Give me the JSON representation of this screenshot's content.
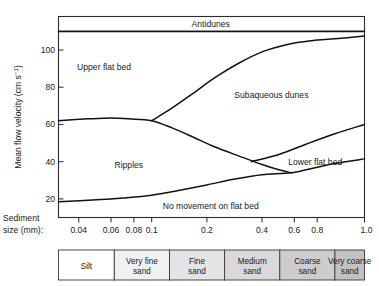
{
  "figure": {
    "title": "",
    "type": "bedform-stability-diagram"
  },
  "axes": {
    "y_label_main": "Mean flow velocity (cm s",
    "y_label_exponent": "−1",
    "y_label_close": ")",
    "y_label_full": "Mean flow velocity (cm s⁻¹)",
    "y_ticks": [
      "20",
      "40",
      "60",
      "80",
      "100"
    ],
    "y_tick_values": [
      20,
      40,
      60,
      80,
      100
    ],
    "y_min": 10,
    "y_max": 118,
    "x_label_line1": "Sediment",
    "x_label_line2": "size (mm):",
    "x_ticks": [
      "0.04",
      "0.06",
      "0.08",
      "0.1",
      "0.2",
      "0.4",
      "0.6",
      "0.8",
      "1.0"
    ],
    "x_tick_values": [
      0.04,
      0.06,
      0.08,
      0.1,
      0.2,
      0.4,
      0.6,
      0.8,
      1.0
    ],
    "x_min": 0.031,
    "x_max": 1.45,
    "x_scale": "log"
  },
  "fields": [
    {
      "name": "antidunes",
      "label": "Antidunes"
    },
    {
      "name": "upper-flat-bed",
      "label": "Upper flat bed"
    },
    {
      "name": "subaqueous-dunes",
      "label": "Subaqueous dunes"
    },
    {
      "name": "ripples",
      "label": "Ripples"
    },
    {
      "name": "lower-flat-bed",
      "label": "Lower flat bed"
    },
    {
      "name": "no-movement",
      "label": "No movement on flat bed"
    }
  ],
  "sediment_scale": {
    "cells": [
      {
        "label_line1": "Silt",
        "label_line2": "",
        "fill": "#ffffff",
        "d_start": 0.031,
        "d_end": 0.0625
      },
      {
        "label_line1": "Very fine",
        "label_line2": "sand",
        "fill": "#f1f1f1",
        "d_start": 0.0625,
        "d_end": 0.125
      },
      {
        "label_line1": "Fine",
        "label_line2": "sand",
        "fill": "#e4e4e4",
        "d_start": 0.125,
        "d_end": 0.25
      },
      {
        "label_line1": "Medium",
        "label_line2": "sand",
        "fill": "#d9d9d9",
        "d_start": 0.25,
        "d_end": 0.5
      },
      {
        "label_line1": "Coarse",
        "label_line2": "sand",
        "fill": "#cdcdcd",
        "d_start": 0.5,
        "d_end": 1.0
      },
      {
        "label_line1": "Very coarse",
        "label_line2": "sand",
        "fill": "#c2c2c2",
        "d_start": 1.0,
        "d_end": 1.45
      }
    ]
  },
  "chart_data": {
    "type": "line",
    "xlabel": "Sediment size (mm)",
    "ylabel": "Mean flow velocity (cm s⁻¹)",
    "xscale": "log",
    "yscale": "linear",
    "xlim": [
      0.031,
      1.45
    ],
    "ylim": [
      10,
      118
    ],
    "grid": false,
    "legend": null,
    "xticks": [
      0.04,
      0.06,
      0.08,
      0.1,
      0.2,
      0.4,
      0.6,
      0.8,
      1.0
    ],
    "xticklabels": [
      "0.04",
      "0.06",
      "0.08",
      "0.1",
      "0.2",
      "0.4",
      "0.6",
      "0.8",
      "1.0"
    ],
    "yticks": [
      20,
      40,
      60,
      80,
      100
    ],
    "yticklabels": [
      "20",
      "40",
      "60",
      "80",
      "100"
    ],
    "annotations": [
      {
        "text": "Antidunes",
        "x": 0.21,
        "y": 114
      },
      {
        "text": "Upper flat bed",
        "x": 0.055,
        "y": 91
      },
      {
        "text": "Subaqueous dunes",
        "x": 0.45,
        "y": 76
      },
      {
        "text": "Ripples",
        "x": 0.075,
        "y": 38
      },
      {
        "text": "Lower flat bed",
        "x": 0.78,
        "y": 40
      },
      {
        "text": "No movement on flat bed",
        "x": 0.21,
        "y": 16
      }
    ],
    "series": [
      {
        "name": "antidunes-boundary",
        "description": "Horizontal boundary between upper flat bed / subaqueous dunes and antidunes",
        "x": [
          0.031,
          1.45
        ],
        "y": [
          110,
          110
        ]
      },
      {
        "name": "upper-flat-bed-upper-boundary",
        "description": "Boundary between upper flat bed and subaqueous dunes; rises from branch point at 0.1 mm",
        "x": [
          0.1,
          0.13,
          0.17,
          0.22,
          0.3,
          0.4,
          0.55,
          0.75,
          1.0,
          1.45
        ],
        "y": [
          62,
          69,
          77,
          85,
          93,
          99,
          103,
          105,
          106,
          107.5
        ]
      },
      {
        "name": "ripples-upper-boundary",
        "description": "Top of ripples field: flat at ~62 cm/s then falls to meet the no-movement curve",
        "x": [
          0.031,
          0.045,
          0.06,
          0.075,
          0.1,
          0.13,
          0.17,
          0.22,
          0.3,
          0.4,
          0.5,
          0.58
        ],
        "y": [
          62,
          63,
          63.5,
          63,
          62,
          58,
          53,
          48,
          43,
          38.5,
          35.5,
          34
        ]
      },
      {
        "name": "lower-flat-bed-upper-boundary",
        "description": "Boundary between subaqueous dunes and lower flat bed, starting at ~0.35 mm",
        "x": [
          0.35,
          0.5,
          0.7,
          1.0,
          1.45
        ],
        "y": [
          40,
          44,
          49.5,
          55,
          60
        ]
      },
      {
        "name": "no-movement-boundary",
        "description": "Threshold of sediment motion; separates no movement from ripples / lower flat bed",
        "x": [
          0.031,
          0.05,
          0.07,
          0.1,
          0.14,
          0.2,
          0.28,
          0.4,
          0.58,
          0.8,
          1.0,
          1.45
        ],
        "y": [
          18.5,
          19.5,
          20.5,
          22,
          24.5,
          27.5,
          30.5,
          33,
          34,
          37,
          39,
          41.5
        ]
      }
    ]
  }
}
